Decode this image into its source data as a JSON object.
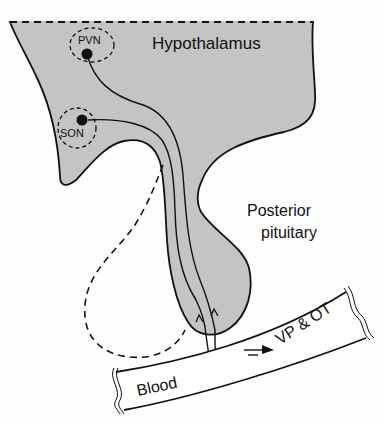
{
  "diagram": {
    "type": "anatomical-schematic",
    "colors": {
      "tissue_fill": "#c4c4c4",
      "stroke": "#111111",
      "background": "#ffffff"
    },
    "regions": {
      "hypothalamus": "Hypothalamus",
      "posterior_pituitary_line1": "Posterior",
      "posterior_pituitary_line2": "pituitary",
      "blood_vessel": "Blood"
    },
    "nuclei": {
      "pvn": "PVN",
      "son": "SON"
    },
    "output_label": "VP & OT"
  }
}
